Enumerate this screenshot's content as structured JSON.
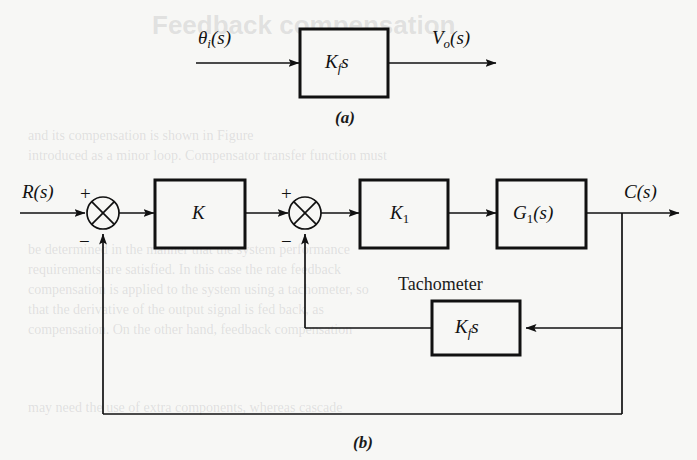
{
  "figure": {
    "background_color": "#f7f7f5",
    "line_color": "#111111",
    "caption_a": "(a)",
    "caption_b": "(b)"
  },
  "diagram_a": {
    "input_label": "θ",
    "input_sub": "i",
    "input_suffix": "(s)",
    "block_label": "K",
    "block_sub": "f",
    "block_suffix": "s",
    "output_label": "V",
    "output_sub": "o",
    "output_suffix": "(s)"
  },
  "diagram_b": {
    "input_label": "R",
    "input_suffix": "(s)",
    "output_label": "C",
    "output_suffix": "(s)",
    "sum1": {
      "plus": "+",
      "minus": "−"
    },
    "sum2": {
      "plus": "+",
      "minus": "−"
    },
    "block_k": {
      "label": "K"
    },
    "block_k1": {
      "label": "K",
      "sub": "1"
    },
    "block_g1": {
      "label": "G",
      "sub": "1",
      "suffix": "(s)"
    },
    "tachometer_title": "Tachometer",
    "block_tach": {
      "label": "K",
      "sub": "f",
      "suffix": "s"
    }
  },
  "bleed_text": {
    "heading": "Feedback compensation",
    "line1": "and its compensation is shown in Figure",
    "line2": "introduced as a minor loop. Compensator transfer function must",
    "line3": "be determined in the manner that the system performance",
    "line4": "requirements are satisfied. In this case the rate feedback",
    "line5": "compensation is applied to the system using a tachometer, so",
    "line6": "that the derivative of the output signal is fed back, as",
    "line7": "compensation. On the other hand, feedback compensation",
    "line8": "may need the use of extra components, whereas cascade"
  }
}
